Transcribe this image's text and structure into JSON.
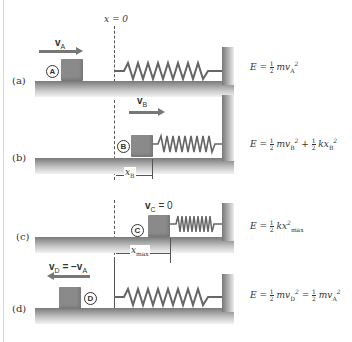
{
  "diagram": {
    "title_marker": "x = 0",
    "panels": [
      {
        "id": "a",
        "label": "(a)",
        "state": "A",
        "velocity_label": "v",
        "velocity_sub": "A",
        "velocity_direction": "right",
        "energy": {
          "lhs": "E = ",
          "terms": [
            "½ mv_A²"
          ],
          "parts": [
            {
              "coef_num": "1",
              "coef_den": "2",
              "var": "mv",
              "sub": "A",
              "sup": "2"
            }
          ]
        }
      },
      {
        "id": "b",
        "label": "(b)",
        "state": "B",
        "velocity_label": "v",
        "velocity_sub": "B",
        "velocity_direction": "right",
        "dimension_label": "x",
        "dimension_sub": "B",
        "energy": {
          "lhs": "E = ",
          "parts": [
            {
              "coef_num": "1",
              "coef_den": "2",
              "var": "mv",
              "sub": "B",
              "sup": "2"
            },
            {
              "coef_num": "1",
              "coef_den": "2",
              "var": "kx",
              "sub": "B",
              "sup": "2"
            }
          ],
          "joiner": " + "
        }
      },
      {
        "id": "c",
        "label": "(c)",
        "state": "C",
        "velocity_label": "v",
        "velocity_sub": "C",
        "velocity_suffix": " = 0",
        "dimension_label": "x",
        "dimension_sub": "max",
        "energy": {
          "lhs": "E = ",
          "parts": [
            {
              "coef_num": "1",
              "coef_den": "2",
              "var": "kx",
              "sub": "max",
              "sup": "2"
            }
          ]
        }
      },
      {
        "id": "d",
        "label": "(d)",
        "state": "D",
        "velocity_label": "v",
        "velocity_sub": "D",
        "velocity_suffix": " = −v",
        "velocity_suffix_sub": "A",
        "velocity_direction": "left",
        "energy": {
          "lhs": "E = ",
          "parts": [
            {
              "coef_num": "1",
              "coef_den": "2",
              "var": "mv",
              "sub": "D",
              "sup": "2"
            },
            {
              "coef_num": "1",
              "coef_den": "2",
              "var": "mv",
              "sub": "A",
              "sup": "2"
            }
          ],
          "joiner": " = "
        }
      }
    ],
    "colors": {
      "block": "#8a8a8a",
      "arrow": "#777777",
      "ground_top": "#7a7a7a",
      "line": "#555555"
    }
  }
}
